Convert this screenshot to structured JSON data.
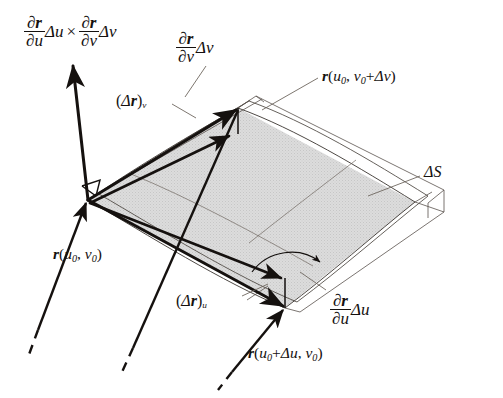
{
  "figure": {
    "type": "vector-calculus-diagram",
    "background_color": "#ffffff",
    "ink_color": "#15110f",
    "patch_fill_color": "#d9d9d9"
  },
  "labels": {
    "normal_cross_product": {
      "text": "∂r/∂u Δu × ∂r/∂v Δv",
      "parts": {
        "frac1_num": "∂r",
        "frac1_den": "∂u",
        "delta_u": "Δu",
        "cross": "×",
        "frac2_num": "∂r",
        "frac2_den": "∂v",
        "delta_v": "Δv"
      }
    },
    "partial_v_dv": {
      "text": "∂r/∂v Δv",
      "parts": {
        "num": "∂r",
        "den": "∂v",
        "delta": "Δv"
      }
    },
    "partial_u_du": {
      "text": "∂r/∂u Δu",
      "parts": {
        "num": "∂r",
        "den": "∂u",
        "delta": "Δu"
      }
    },
    "delta_r_v": {
      "text": "(Δr)v",
      "parts": {
        "open": "(",
        "delta": "Δ",
        "vec": "r",
        "close": ")",
        "sub": "v"
      }
    },
    "delta_r_u": {
      "text": "(Δr)u",
      "parts": {
        "open": "(",
        "delta": "Δ",
        "vec": "r",
        "close": ")",
        "sub": "u"
      }
    },
    "r_u0_v0": {
      "text": "r(u0, v0)",
      "parts": {
        "vec": "r",
        "open": "(",
        "u": "u",
        "u_sub": "0",
        "comma": ",",
        "v": "v",
        "v_sub": "0",
        "close": ")"
      }
    },
    "r_u0_v0_plus_dv": {
      "text": "r(u0, v0+Δv)",
      "parts": {
        "vec": "r",
        "open": "(",
        "u": "u",
        "u_sub": "0",
        "comma": ",",
        "v": "v",
        "v_sub": "0",
        "plus": "+",
        "delta": "Δv",
        "close": ")"
      }
    },
    "r_u0_plus_du_v0": {
      "text": "r(u0+Δu, v0)",
      "parts": {
        "vec": "r",
        "open": "(",
        "u": "u",
        "u_sub": "0",
        "plus": "+",
        "delta": "Δu",
        "comma": ",",
        "v": "v",
        "v_sub": "0",
        "close": ")"
      }
    },
    "delta_S": {
      "text": "ΔS",
      "parts": {
        "delta": "Δ",
        "S": "S"
      }
    }
  },
  "geometry": {
    "base_vertex": [
      88,
      200
    ],
    "tangent_parallelogram": [
      [
        88,
        200
      ],
      [
        238,
        108
      ],
      [
        415,
        202
      ],
      [
        285,
        308
      ]
    ],
    "normal_arrow_tip": [
      72,
      63
    ],
    "right_angle_marker": [
      95,
      186
    ],
    "angle_arc_center": [
      285,
      308
    ],
    "vectors": [
      {
        "name": "partial-v-dv",
        "from": [
          88,
          200
        ],
        "to": [
          238,
          108
        ]
      },
      {
        "name": "delta-r-v",
        "from": [
          88,
          200
        ],
        "to": [
          231,
          134
        ]
      },
      {
        "name": "partial-u-du",
        "from": [
          88,
          200
        ],
        "to": [
          285,
          308
        ]
      },
      {
        "name": "delta-r-u",
        "from": [
          88,
          200
        ],
        "to": [
          283,
          279
        ]
      },
      {
        "name": "normal",
        "from": [
          88,
          200
        ],
        "to": [
          72,
          63
        ]
      }
    ],
    "position_vectors": [
      {
        "name": "r-u0-v0",
        "to": [
          88,
          200
        ],
        "tail": [
          30,
          372
        ]
      },
      {
        "name": "r-u0-du-v0",
        "to": [
          285,
          308
        ],
        "tail": [
          222,
          395
        ]
      }
    ]
  }
}
